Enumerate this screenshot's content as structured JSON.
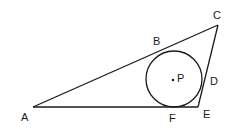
{
  "diagram": {
    "colors": {
      "stroke": "#1a1a1a",
      "background": "#ffffff"
    },
    "vertices": {
      "A": {
        "x": 33,
        "y": 107
      },
      "C": {
        "x": 218,
        "y": 25
      },
      "E": {
        "x": 198,
        "y": 107
      }
    },
    "circle": {
      "center_label": "P",
      "cx": 174,
      "cy": 79,
      "r": 28
    },
    "labels": {
      "A": "A",
      "B": "B",
      "C": "C",
      "D": "D",
      "E": "E",
      "F": "F",
      "P": "P"
    }
  }
}
